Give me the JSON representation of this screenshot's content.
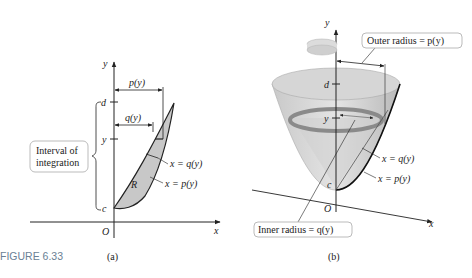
{
  "figure_label": "FIGURE 6.33",
  "panel_a": {
    "caption": "(a)",
    "axis_x": "x",
    "axis_y": "y",
    "origin": "O",
    "tick_d": "d",
    "tick_y": "y",
    "tick_c": "c",
    "dim_p": "p(y)",
    "dim_q": "q(y)",
    "region": "R",
    "curve_q": "x = q(y)",
    "curve_p": "x = p(y)",
    "callout_line1": "Interval of",
    "callout_line2": "integration"
  },
  "panel_b": {
    "caption": "(b)",
    "axis_x": "x",
    "axis_y": "y",
    "origin": "O",
    "tick_d": "d",
    "tick_y": "y",
    "tick_c": "c",
    "curve_q": "x = q(y)",
    "curve_p": "x = p(y)",
    "outer_label": "Outer radius = p(y)",
    "inner_label": "Inner radius = q(y)"
  }
}
